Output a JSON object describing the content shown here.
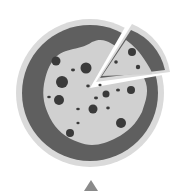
{
  "image": {
    "subject": "pizza-icon",
    "style": "grayscale flat illustration",
    "colors": {
      "background": "#ffffff",
      "plate": "#d9d9d9",
      "crust": "#5e5e5e",
      "cheese": "#cfcfcf",
      "topping": "#3a3a3a",
      "cursor": "#8a8a8a"
    }
  }
}
